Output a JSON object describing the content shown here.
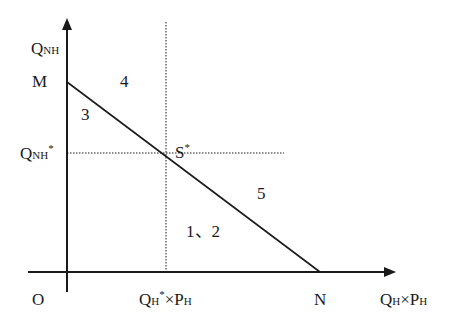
{
  "diagram": {
    "type": "economic-line-diagram",
    "y_axis": {
      "label_main": "Q",
      "label_sub": "NH"
    },
    "x_axis": {
      "label_main1": "Q",
      "label_sub1": "H",
      "times": "×",
      "label_main2": "P",
      "label_sub2": "H"
    },
    "origin_label": "O",
    "points": {
      "M": "M",
      "N": "N",
      "S_main": "S",
      "S_sup": "*"
    },
    "y_tick": {
      "main": "Q",
      "sub": "NH",
      "sup": "*"
    },
    "x_tick": {
      "main1": "Q",
      "sub1": "H",
      "sup": "*",
      "times": "×",
      "main2": "P",
      "sub2": "H"
    },
    "regions": {
      "r3": "3",
      "r4": "4",
      "r5": "5",
      "r12": "1、2"
    },
    "colors": {
      "line": "#1a1a1a",
      "background": "#ffffff"
    }
  }
}
